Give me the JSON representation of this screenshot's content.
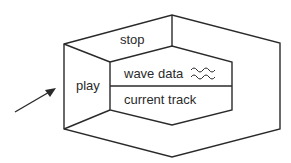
{
  "diagram": {
    "regions": {
      "top": {
        "label": "stop"
      },
      "left": {
        "label": "play"
      },
      "inner_upper": {
        "label": "wave data",
        "icon": "wave-icon"
      },
      "inner_lower": {
        "label": "current track"
      }
    },
    "arrow": {
      "direction": "pointing-up-right",
      "target": "play"
    },
    "colors": {
      "stroke": "#2a2a2a",
      "background": "#ffffff"
    }
  }
}
